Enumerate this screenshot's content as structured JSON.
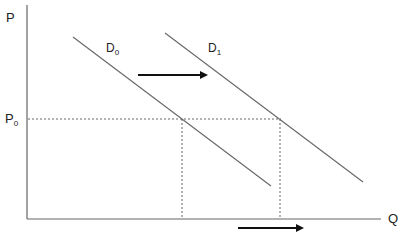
{
  "diagram": {
    "type": "supply-demand-shift",
    "axes": {
      "y_label": "P",
      "x_label": "Q"
    },
    "price_level": {
      "label": "P",
      "subscript": "0"
    },
    "curves": [
      {
        "name": "D",
        "subscript": "0",
        "role": "original demand"
      },
      {
        "name": "D",
        "subscript": "1",
        "role": "shifted demand"
      }
    ],
    "arrows": [
      {
        "name": "demand-shift-arrow",
        "direction": "right"
      },
      {
        "name": "quantity-increase-arrow",
        "direction": "right"
      }
    ],
    "colors": {
      "axis": "#555555",
      "curve": "#555555",
      "dashed": "#555555",
      "arrow": "#111111",
      "text": "#222222"
    }
  }
}
